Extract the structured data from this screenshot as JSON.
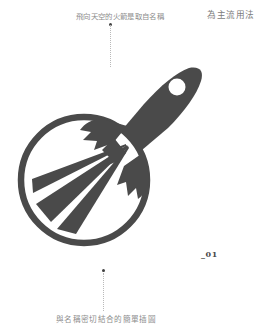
{
  "page": {
    "background_color": "#ffffff",
    "width": 273,
    "height": 334
  },
  "annotations": {
    "top_caption": "飛向天空的火箭是取自名稱",
    "right_caption": "為主流用法",
    "bottom_caption": "與名稱密切結合的簡單插圖",
    "index_label": "_01",
    "caption_color": "#8d8d8d",
    "leader_color": "#b9b9b9",
    "dot_color": "#3f3f3f"
  },
  "logo": {
    "name": "rocket-and-rays-logo",
    "ink_color": "#4a4a4a",
    "elements": [
      "circle-outline",
      "ray-beam-left",
      "ray-beam-middle",
      "ray-beam-right",
      "rocket-body",
      "rocket-window",
      "rocket-fin-upper",
      "rocket-fin-lower",
      "rocket-nozzle"
    ]
  }
}
